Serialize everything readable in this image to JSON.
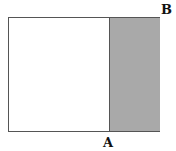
{
  "diagram": {
    "labels": {
      "a": "A",
      "b": "B"
    },
    "colors": {
      "outline": "#555555",
      "shaded_region": "#a9a9a9",
      "background": "#ffffff"
    }
  }
}
